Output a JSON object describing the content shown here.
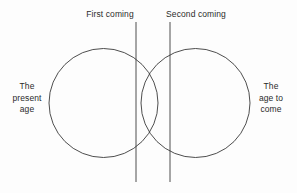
{
  "diagram": {
    "background_color": "#fdfdfd",
    "stroke_color": "#3a3a3a",
    "text_color": "#2b2b2b",
    "labels": {
      "first_coming": "First coming",
      "second_coming": "Second coming",
      "present_age": {
        "line1": "The",
        "line2": "present",
        "line3": "age"
      },
      "age_to_come": {
        "line1": "The",
        "line2": "age to",
        "line3": "come"
      }
    },
    "shapes": {
      "left_circle": {
        "cx": 103.5,
        "cy": 103,
        "r": 54.5
      },
      "right_circle": {
        "cx": 195.5,
        "cy": 103,
        "r": 54.5
      },
      "first_coming_line": {
        "x": 136,
        "y1": 22,
        "y2": 182
      },
      "second_coming_line": {
        "x": 170,
        "y1": 22,
        "y2": 182
      }
    }
  }
}
